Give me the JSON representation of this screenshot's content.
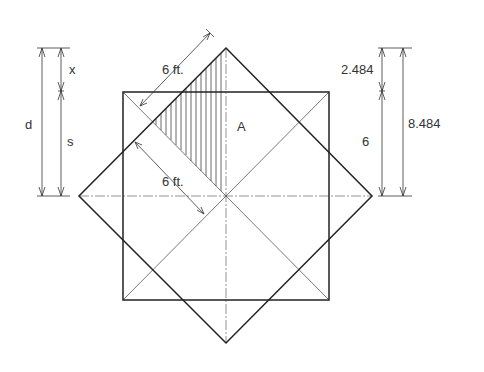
{
  "figure": {
    "type": "geometric construction diagram"
  },
  "labels": {
    "area_label": "A",
    "diag_dim_top": "6 ft.",
    "diag_dim_mid": "6 ft.",
    "left_overall": "d",
    "left_upper": "x",
    "left_lower": "s",
    "right_upper": "2.484",
    "right_lower": "6",
    "right_overall": "8.484"
  },
  "dimensions": {
    "half_side_ft": 6,
    "overhang": 2.484,
    "half_diagonal": 8.484
  },
  "colors": {
    "line": "#222222",
    "thin_line": "#555555",
    "text": "#333333",
    "background": "#ffffff"
  }
}
